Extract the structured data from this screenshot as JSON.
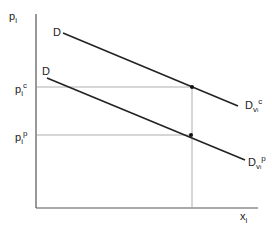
{
  "diagram": {
    "type": "price-demand diagram",
    "axes": {
      "y_label": "p",
      "y_label_sub": "i",
      "x_label": "x",
      "x_label_sub": "i"
    },
    "price_levels": [
      {
        "id": "pc",
        "label": "p",
        "sub": "i",
        "sup": "c"
      },
      {
        "id": "pp",
        "label": "p",
        "sub": "i",
        "sup": "p"
      }
    ],
    "curves": [
      {
        "id": "upper",
        "start_label": "D",
        "end_label": "D",
        "end_sub": "v",
        "end_sub_sub": "i",
        "end_sup": "c"
      },
      {
        "id": "lower",
        "start_label": "D",
        "end_label": "D",
        "end_sub": "v",
        "end_sub_sub": "i",
        "end_sup": "p"
      }
    ],
    "colors": {
      "line": "#222222",
      "guide": "#888888"
    }
  }
}
